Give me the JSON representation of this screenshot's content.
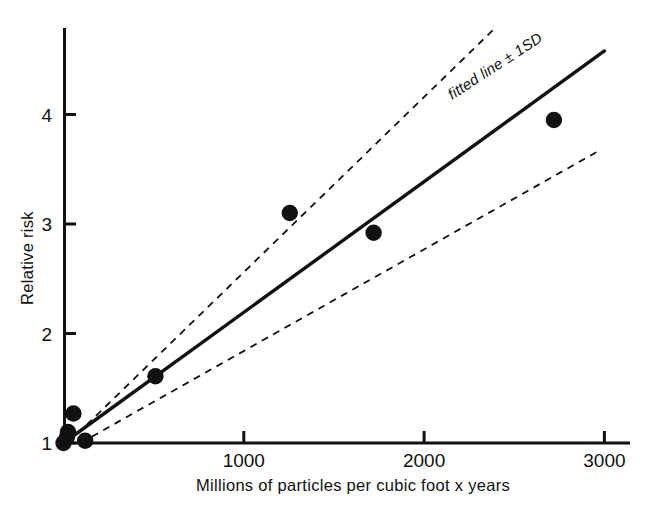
{
  "chart_data": {
    "type": "scatter",
    "title": "",
    "xlabel": "Millions of particles per cubic foot x years",
    "ylabel": "Relative risk",
    "xlim": [
      0,
      3150
    ],
    "ylim": [
      0.92,
      4.75
    ],
    "grid": false,
    "legend_position": "inline-along-line",
    "x_ticks": [
      1000,
      2000,
      3000
    ],
    "x_tick_labels": [
      "1000",
      "2000",
      "3000"
    ],
    "y_ticks": [
      1,
      2,
      3,
      4
    ],
    "y_tick_labels": [
      "1",
      "2",
      "3",
      "4"
    ],
    "points": [
      {
        "x": 0,
        "y": 1.0
      },
      {
        "x": 25,
        "y": 1.1
      },
      {
        "x": 20,
        "y": 1.06
      },
      {
        "x": 55,
        "y": 1.27
      },
      {
        "x": 120,
        "y": 1.02
      },
      {
        "x": 510,
        "y": 1.61
      },
      {
        "x": 1255,
        "y": 3.1
      },
      {
        "x": 1720,
        "y": 2.92
      },
      {
        "x": 2720,
        "y": 3.95
      }
    ],
    "series": [
      {
        "name": "fitted line",
        "style": "solid",
        "points": [
          {
            "x": 0,
            "y": 1.0
          },
          {
            "x": 3000,
            "y": 4.58
          }
        ]
      },
      {
        "name": "upper 1SD",
        "style": "dashed",
        "points": [
          {
            "x": 25,
            "y": 1.0
          },
          {
            "x": 2400,
            "y": 4.8
          }
        ]
      },
      {
        "name": "lower 1SD",
        "style": "dashed",
        "points": [
          {
            "x": 95,
            "y": 1.0
          },
          {
            "x": 2960,
            "y": 3.66
          }
        ]
      }
    ],
    "annotations": [
      {
        "text": "fitted line ± 1SD",
        "kind": "fit-line-label",
        "rotation": -33
      }
    ],
    "colors": {
      "ink": "#111111",
      "background": "#ffffff",
      "marker": "#111111"
    }
  }
}
